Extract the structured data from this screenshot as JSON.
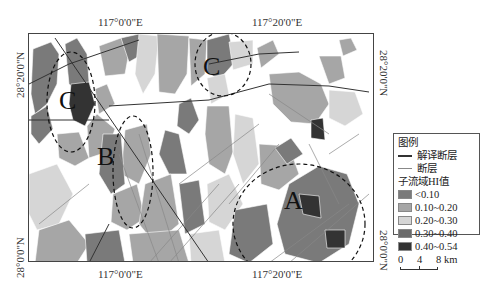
{
  "axes": {
    "top_ticks": [
      "117°0'0\"E",
      "117°20'0\"E"
    ],
    "bottom_ticks": [
      "117°0'0\"E",
      "117°20'0\"E"
    ],
    "left_ticks": [
      "28°20'0\"N",
      "28°0'0\"N"
    ],
    "right_ticks": [
      "28°20'0\"N",
      "28°0'0\"N"
    ]
  },
  "zones": [
    "A",
    "B",
    "C",
    "C"
  ],
  "legend": {
    "title": "图例",
    "line_items": [
      {
        "label": "解译断层",
        "color": "#333333"
      },
      {
        "label": "断层",
        "color": "#888888"
      }
    ],
    "hi_title": "子流域HI值",
    "classes": [
      {
        "label": "<0.10",
        "color": "#7a7a7a"
      },
      {
        "label": "0.10~0.20",
        "color": "#a6a6a6"
      },
      {
        "label": "0.20~0.30",
        "color": "#d6d6d6"
      },
      {
        "label": "0.30~0.40",
        "color": "#6a6a6a"
      },
      {
        "label": "0.40~0.54",
        "color": "#333333"
      }
    ]
  },
  "scale_bar": {
    "labels": [
      "0",
      "4",
      "8 km"
    ]
  }
}
